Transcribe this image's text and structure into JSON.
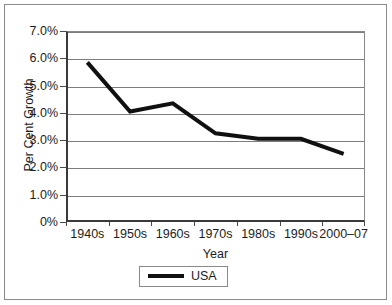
{
  "chart_data": {
    "type": "line",
    "title": "",
    "xlabel": "Year",
    "ylabel": "Per Cent Growth",
    "categories": [
      "1940s",
      "1950s",
      "1960s",
      "1970s",
      "1980s",
      "1990s",
      "2000–07"
    ],
    "series": [
      {
        "name": "USA",
        "values": [
          5.85,
          4.05,
          4.35,
          3.25,
          3.05,
          3.05,
          2.5
        ],
        "color": "#101010"
      }
    ],
    "ylim": [
      0,
      7
    ],
    "ytick_values": [
      0,
      1,
      2,
      3,
      4,
      5,
      6,
      7
    ],
    "ytick_labels": [
      "0%",
      "1.0%",
      "2.0%",
      "3.0%",
      "4.0%",
      "5.0%",
      "6.0%",
      "7.0%"
    ],
    "grid": "horizontal",
    "legend_position": "bottom-center",
    "legend_entries": [
      "USA"
    ]
  },
  "legend": {
    "usa_label": "USA"
  },
  "axes": {
    "x_title": "Year",
    "y_title": "Per Cent Growth"
  }
}
